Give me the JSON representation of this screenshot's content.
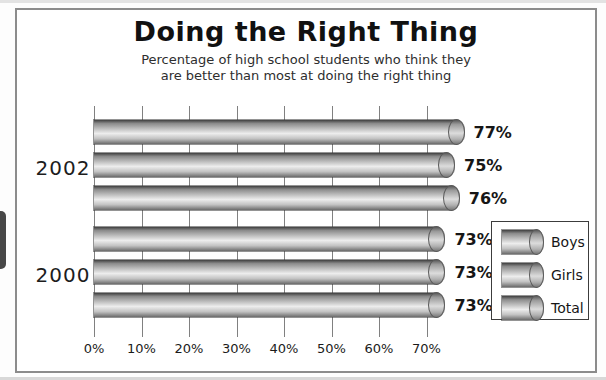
{
  "title": "Doing the Right Thing",
  "subtitle_line1": "Percentage of high school students who think they",
  "subtitle_line2": "are better than most at doing the right thing",
  "chart_data": {
    "type": "bar",
    "orientation": "horizontal",
    "title": "Doing the Right Thing",
    "subtitle": "Percentage of high school students who think they are better than most at doing the right thing",
    "categories": [
      "2002",
      "2000"
    ],
    "series": [
      {
        "name": "Boys",
        "values": [
          77,
          73
        ]
      },
      {
        "name": "Girls",
        "values": [
          75,
          73
        ]
      },
      {
        "name": "Total",
        "values": [
          76,
          73
        ]
      }
    ],
    "value_label_suffix": "%",
    "x_ticks": [
      "0%",
      "10%",
      "20%",
      "30%",
      "40%",
      "50%",
      "60%",
      "70%"
    ],
    "xlim": [
      0,
      70
    ],
    "grid": true,
    "legend": {
      "position": "right",
      "items": [
        "Boys",
        "Girls",
        "Total"
      ]
    },
    "bar_style": "gray-3d-cylinder"
  },
  "colors": {
    "frame_border": "#8c8c8c",
    "gridline": "#808080",
    "bar_dark": "#3f3f3f",
    "bar_light": "#ededed",
    "text": "#161616",
    "tab": "#474747",
    "background": "#ffffff"
  }
}
